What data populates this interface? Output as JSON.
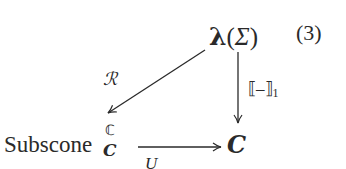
{
  "diagram": {
    "type": "commutative-diagram",
    "equation_number": "(3)",
    "nodes": {
      "top": {
        "bold_symbol": "λ",
        "open_paren": "(",
        "argument": "Σ",
        "close_paren": ")"
      },
      "bottom_left": {
        "base": "Subscone",
        "superscript": "ℂ",
        "subscript": "C"
      },
      "bottom_right": {
        "label": "C"
      }
    },
    "arrows": [
      {
        "from": "top",
        "to": "bottom_left",
        "label": "ℛ"
      },
      {
        "from": "top",
        "to": "bottom_right",
        "label": "⟦–⟧",
        "label_subscript": "1"
      },
      {
        "from": "bottom_left",
        "to": "bottom_right",
        "label": "U"
      }
    ],
    "colors": {
      "ink": "#2a2a2a",
      "background": "#ffffff"
    }
  }
}
